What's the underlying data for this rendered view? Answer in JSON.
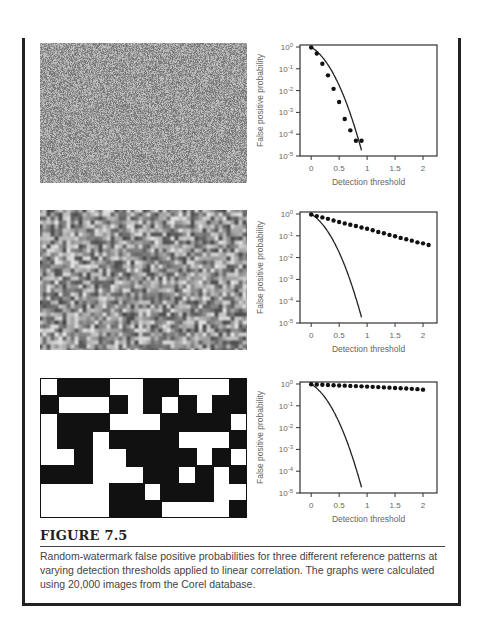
{
  "figure": {
    "label": "FIGURE 7.5",
    "caption": "Random-watermark false positive probabilities for three different reference patterns at varying detection thresholds applied to linear correlation. The graphs were calculated using 20,000 images from the Corel database."
  },
  "patterns": [
    {
      "name": "white-noise-pattern",
      "type": "noise",
      "scale": 1
    },
    {
      "name": "lowpass-noise-pattern",
      "type": "noise",
      "scale": 4
    },
    {
      "name": "block-pattern",
      "type": "blocks",
      "grid": [
        "WBBBWWBBWWWB",
        "BWWWBWBWBWBB",
        "WBBBWWWBBBBW",
        "WBBWBBBBWWWB",
        "WWBWWBBBBWBW",
        "BBBWWWBBWBWB",
        "WWWWBBWBBBWW",
        "WWWWBBBWWWWB"
      ]
    }
  ],
  "chart_data": [
    {
      "type": "scatter",
      "title": "",
      "xlabel": "Detection threshold",
      "ylabel": "False positive probability",
      "xlim": [
        -0.2,
        2.25
      ],
      "ylim": [
        1e-05,
        1
      ],
      "yscale": "log",
      "xticks": [
        "0",
        "0.5",
        "1",
        "1.5",
        "2"
      ],
      "yticks": [
        "10^0",
        "10^-1",
        "10^-2",
        "10^-3",
        "10^-4",
        "10^-5"
      ],
      "grid": false,
      "series": [
        {
          "name": "measured",
          "style": "dots",
          "x": [
            0,
            0.1,
            0.2,
            0.3,
            0.4,
            0.5,
            0.6,
            0.7,
            0.8,
            0.9
          ],
          "y": [
            0.95,
            0.5,
            0.17,
            0.05,
            0.012,
            0.003,
            0.0005,
            0.00015,
            5e-05,
            5e-05
          ]
        },
        {
          "name": "theoretical",
          "style": "line",
          "curve": "gaussian_tail",
          "x_end": 0.9
        }
      ]
    },
    {
      "type": "scatter",
      "title": "",
      "xlabel": "Detection threshold",
      "ylabel": "False positive probability",
      "xlim": [
        -0.2,
        2.25
      ],
      "ylim": [
        1e-05,
        1
      ],
      "yscale": "log",
      "xticks": [
        "0",
        "0.5",
        "1",
        "1.5",
        "2"
      ],
      "yticks": [
        "10^0",
        "10^-1",
        "10^-2",
        "10^-3",
        "10^-4",
        "10^-5"
      ],
      "grid": false,
      "series": [
        {
          "name": "measured",
          "style": "dots",
          "x": [
            0,
            0.1,
            0.2,
            0.3,
            0.4,
            0.5,
            0.6,
            0.7,
            0.8,
            0.9,
            1.0,
            1.1,
            1.2,
            1.3,
            1.4,
            1.5,
            1.6,
            1.7,
            1.8,
            1.9,
            2.0,
            2.1
          ],
          "y": [
            0.95,
            0.8,
            0.7,
            0.6,
            0.5,
            0.43,
            0.37,
            0.32,
            0.28,
            0.24,
            0.21,
            0.18,
            0.15,
            0.13,
            0.11,
            0.095,
            0.08,
            0.07,
            0.06,
            0.05,
            0.045,
            0.038
          ]
        },
        {
          "name": "theoretical",
          "style": "line",
          "curve": "gaussian_tail",
          "x_end": 0.9
        }
      ]
    },
    {
      "type": "scatter",
      "title": "",
      "xlabel": "Detection threshold",
      "ylabel": "False positive probability",
      "xlim": [
        -0.2,
        2.25
      ],
      "ylim": [
        1e-05,
        1
      ],
      "yscale": "log",
      "xticks": [
        "0",
        "0.5",
        "1",
        "1.5",
        "2"
      ],
      "yticks": [
        "10^0",
        "10^-1",
        "10^-2",
        "10^-3",
        "10^-4",
        "10^-5"
      ],
      "grid": false,
      "series": [
        {
          "name": "measured",
          "style": "dots",
          "x": [
            0,
            0.1,
            0.2,
            0.3,
            0.4,
            0.5,
            0.6,
            0.7,
            0.8,
            0.9,
            1.0,
            1.1,
            1.2,
            1.3,
            1.4,
            1.5,
            1.6,
            1.7,
            1.8,
            1.9,
            2.0
          ],
          "y": [
            0.98,
            0.95,
            0.92,
            0.9,
            0.88,
            0.86,
            0.84,
            0.82,
            0.8,
            0.78,
            0.76,
            0.74,
            0.72,
            0.7,
            0.68,
            0.66,
            0.64,
            0.62,
            0.6,
            0.58,
            0.55
          ]
        },
        {
          "name": "theoretical",
          "style": "line",
          "curve": "gaussian_tail",
          "x_end": 0.9
        }
      ]
    }
  ]
}
